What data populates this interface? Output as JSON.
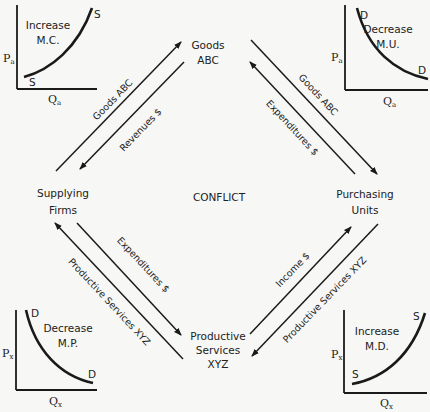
{
  "nodes": {
    "goods": [
      "Goods",
      "ABC"
    ],
    "supplying_firms": [
      "Supplying",
      "Firms"
    ],
    "purchasing_units": [
      "Purchasing",
      "Units"
    ],
    "productive_services": [
      "Productive",
      "Services",
      "XYZ"
    ],
    "center": "CONFLICT"
  },
  "flows": {
    "top_left_outer": "Goods ABC",
    "top_left_inner": "Revenues $",
    "top_right_outer": "Goods ABC",
    "top_right_inner": "Expenditures $",
    "bottom_left_outer": "Productive Services XYZ",
    "bottom_left_inner": "Expenditures $",
    "bottom_right_outer": "Income $",
    "bottom_right_inner": "Productive Services XYZ"
  },
  "graphs": {
    "top_left": {
      "title": [
        "Increase",
        "M.C."
      ],
      "curve_label": "S",
      "y_axis": "P",
      "y_sub": "a",
      "x_axis": "Q",
      "x_sub": "a",
      "type": "supply"
    },
    "top_right": {
      "title": [
        "Decrease",
        "M.U."
      ],
      "curve_label": "D",
      "y_axis": "P",
      "y_sub": "a",
      "x_axis": "Q",
      "x_sub": "a",
      "type": "demand"
    },
    "bottom_left": {
      "title": [
        "Decrease",
        "M.P."
      ],
      "curve_label": "D",
      "y_axis": "P",
      "y_sub": "x",
      "x_axis": "Q",
      "x_sub": "x",
      "type": "demand"
    },
    "bottom_right": {
      "title": [
        "Increase",
        "M.D."
      ],
      "curve_label": "S",
      "y_axis": "P",
      "y_sub": "x",
      "x_axis": "Q",
      "x_sub": "x",
      "type": "supply"
    }
  },
  "colors": {
    "ink": "#1a1a1a",
    "background": "#f7f7f5"
  }
}
